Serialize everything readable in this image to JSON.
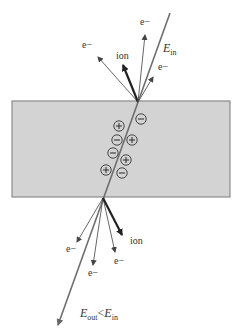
{
  "diagram": {
    "colors": {
      "slab_fill": "#d3d3d3",
      "slab_border": "#8a8a8a",
      "line": "#6e6e6e",
      "arrow": "#555555",
      "ion_arrow": "#222222",
      "text": "#333333"
    },
    "slab": {
      "x": 12,
      "y": 101,
      "width": 218,
      "height": 96
    },
    "beam": {
      "start": [
        170,
        13
      ],
      "entry": [
        138,
        102
      ],
      "exit": [
        103,
        198
      ],
      "end": [
        58,
        325
      ],
      "label_in": {
        "E": "E",
        "sub": "in",
        "x": 163,
        "y": 52
      },
      "label_out": {
        "E_out": "E",
        "sub_out": "out",
        "lt": "<",
        "E_in": "E",
        "sub_in": "in",
        "x": 80,
        "y": 317
      }
    },
    "top_emissions": [
      {
        "type": "e",
        "label": "e−",
        "tip": [
          98,
          57
        ],
        "label_pos": [
          82,
          48
        ],
        "bold": false
      },
      {
        "type": "ion",
        "label": "ion",
        "tip": [
          123,
          65
        ],
        "label_pos": [
          116,
          59
        ],
        "bold": true
      },
      {
        "type": "e",
        "label": "e−",
        "tip": [
          145,
          35
        ],
        "label_pos": [
          140,
          25
        ],
        "bold": false
      },
      {
        "type": "e",
        "label": "e−",
        "tip": [
          153,
          77
        ],
        "label_pos": [
          158,
          70
        ],
        "bold": false
      }
    ],
    "bottom_emissions": [
      {
        "type": "e",
        "label": "e−",
        "tip": [
          77,
          242
        ],
        "label_pos": [
          66,
          252
        ],
        "bold": false
      },
      {
        "type": "e",
        "label": "e−",
        "tip": [
          93,
          265
        ],
        "label_pos": [
          88,
          276
        ],
        "bold": false
      },
      {
        "type": "e",
        "label": "e−",
        "tip": [
          115,
          252
        ],
        "label_pos": [
          114,
          264
        ],
        "bold": false
      },
      {
        "type": "ion",
        "label": "ion",
        "tip": [
          122,
          235
        ],
        "label_pos": [
          130,
          244
        ],
        "bold": true
      }
    ],
    "charges": [
      {
        "sign": "−",
        "x": 141,
        "y": 119
      },
      {
        "sign": "+",
        "x": 119,
        "y": 126
      },
      {
        "sign": "−",
        "x": 117,
        "y": 140
      },
      {
        "sign": "+",
        "x": 132,
        "y": 140
      },
      {
        "sign": "−",
        "x": 113,
        "y": 153
      },
      {
        "sign": "+",
        "x": 126,
        "y": 160
      },
      {
        "sign": "+",
        "x": 106,
        "y": 170
      },
      {
        "sign": "−",
        "x": 122,
        "y": 173
      }
    ]
  }
}
